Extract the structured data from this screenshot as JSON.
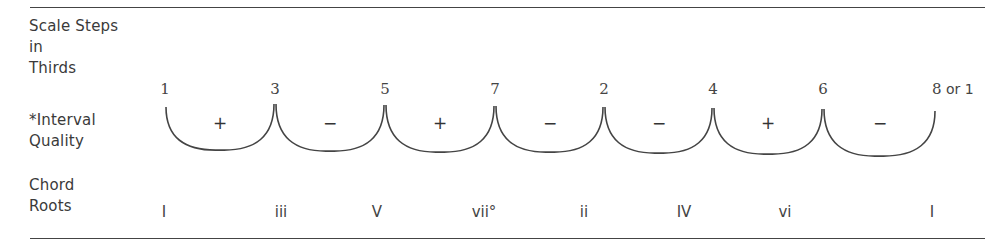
{
  "row_labels": {
    "scale_steps": [
      "Scale Steps",
      "in",
      "Thirds"
    ],
    "interval_quality": [
      "*Interval",
      "Quality"
    ],
    "chord_roots": [
      "Chord",
      "Roots"
    ]
  },
  "scale_steps": [
    "1",
    "3",
    "5",
    "7",
    "2",
    "4",
    "6",
    "8"
  ],
  "last_step_suffix": " or 1",
  "interval_qualities": [
    "+",
    "−",
    "+",
    "−",
    "−",
    "+",
    "−"
  ],
  "chord_roots": [
    "I",
    "iii",
    "V",
    "vii°",
    "ii",
    "IV",
    "vi",
    "I"
  ]
}
